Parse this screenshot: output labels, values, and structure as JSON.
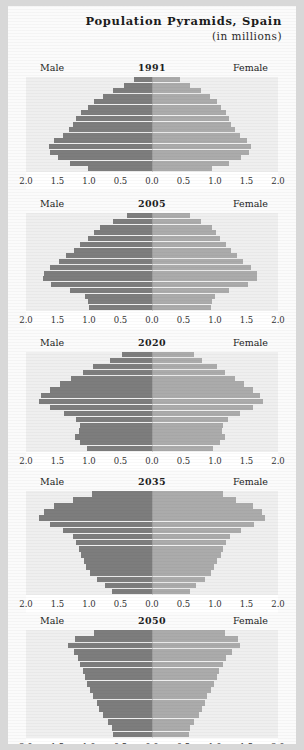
{
  "header": {
    "title": "Population Pyramids, Spain",
    "subtitle": "(in millions)"
  },
  "labels": {
    "male": "Male",
    "female": "Female"
  },
  "colors": {
    "male_bar": "#7d7d7d",
    "female_bar": "#ababab",
    "plot_background": "#efefef",
    "figure_background": "#fbfbfb",
    "page_background": "#d8d8d8"
  },
  "axis": {
    "ticks": [
      "2.0",
      "1.5",
      "1.0",
      "0.5",
      "0.0",
      "0.5",
      "1.0",
      "1.5",
      "2.0"
    ],
    "limit": 2.0
  },
  "chart_data": {
    "type": "bar",
    "title": "Population Pyramids, Spain",
    "subtitle": "(in millions)",
    "xlabel": "",
    "ylabel": "",
    "xlim": [
      -2.0,
      2.0
    ],
    "grid": false,
    "legend": [
      "Male",
      "Female"
    ],
    "orientation": "horizontal-diverging",
    "note": "Five stacked population pyramid panels for Spain. Each panel has 17 five-year age cohorts from youngest (bottom) to oldest (top). Values are population in millions; male values are plotted leftward, female values rightward.",
    "age_groups_bottom_to_top": [
      "0-4",
      "5-9",
      "10-14",
      "15-19",
      "20-24",
      "25-29",
      "30-34",
      "35-39",
      "40-44",
      "45-49",
      "50-54",
      "55-59",
      "60-64",
      "65-69",
      "70-74",
      "75-79",
      "80+"
    ],
    "panels": [
      {
        "year": "1991",
        "male": [
          1.02,
          1.3,
          1.5,
          1.62,
          1.63,
          1.55,
          1.42,
          1.32,
          1.25,
          1.2,
          1.13,
          1.02,
          0.92,
          0.78,
          0.62,
          0.44,
          0.28
        ],
        "female": [
          0.96,
          1.23,
          1.42,
          1.54,
          1.57,
          1.5,
          1.4,
          1.31,
          1.26,
          1.23,
          1.18,
          1.1,
          1.03,
          0.92,
          0.78,
          0.6,
          0.44
        ]
      },
      {
        "year": "2005",
        "male": [
          1.0,
          1.02,
          1.06,
          1.3,
          1.6,
          1.73,
          1.72,
          1.62,
          1.48,
          1.36,
          1.24,
          1.14,
          1.02,
          0.92,
          0.82,
          0.62,
          0.4
        ],
        "female": [
          0.94,
          0.96,
          1.0,
          1.23,
          1.52,
          1.66,
          1.66,
          1.57,
          1.45,
          1.35,
          1.25,
          1.17,
          1.08,
          1.01,
          0.95,
          0.78,
          0.6
        ]
      },
      {
        "year": "2020",
        "male": [
          1.03,
          1.14,
          1.22,
          1.16,
          1.14,
          1.2,
          1.4,
          1.62,
          1.8,
          1.76,
          1.62,
          1.46,
          1.28,
          1.1,
          0.93,
          0.66,
          0.47
        ],
        "female": [
          0.97,
          1.08,
          1.16,
          1.11,
          1.12,
          1.2,
          1.4,
          1.6,
          1.76,
          1.72,
          1.6,
          1.46,
          1.31,
          1.16,
          1.03,
          0.8,
          0.67
        ]
      },
      {
        "year": "2035",
        "male": [
          0.64,
          0.74,
          0.88,
          0.98,
          1.04,
          1.08,
          1.13,
          1.16,
          1.2,
          1.25,
          1.42,
          1.62,
          1.8,
          1.72,
          1.55,
          1.25,
          0.96
        ],
        "female": [
          0.6,
          0.7,
          0.84,
          0.93,
          0.99,
          1.03,
          1.09,
          1.13,
          1.18,
          1.24,
          1.42,
          1.62,
          1.8,
          1.74,
          1.6,
          1.34,
          1.12
        ]
      },
      {
        "year": "2050",
        "male": [
          0.62,
          0.64,
          0.7,
          0.78,
          0.84,
          0.88,
          0.93,
          0.98,
          1.03,
          1.07,
          1.1,
          1.14,
          1.18,
          1.24,
          1.33,
          1.22,
          0.92
        ],
        "female": [
          0.58,
          0.6,
          0.66,
          0.74,
          0.8,
          0.84,
          0.88,
          0.93,
          0.99,
          1.03,
          1.07,
          1.12,
          1.18,
          1.27,
          1.4,
          1.36,
          1.16
        ]
      }
    ]
  }
}
